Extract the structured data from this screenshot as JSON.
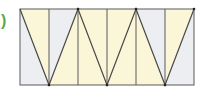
{
  "label": ")",
  "colors": {
    "yellow": "#fcf6d9",
    "gray": "#eceef1",
    "stroke": "#5a5a5a",
    "label": "#5aa84a"
  },
  "figure": {
    "strips": 6,
    "top_vertices_x": [
      20,
      78,
      136,
      194
    ],
    "bottom_vertices_x": [
      49,
      107,
      165
    ]
  }
}
